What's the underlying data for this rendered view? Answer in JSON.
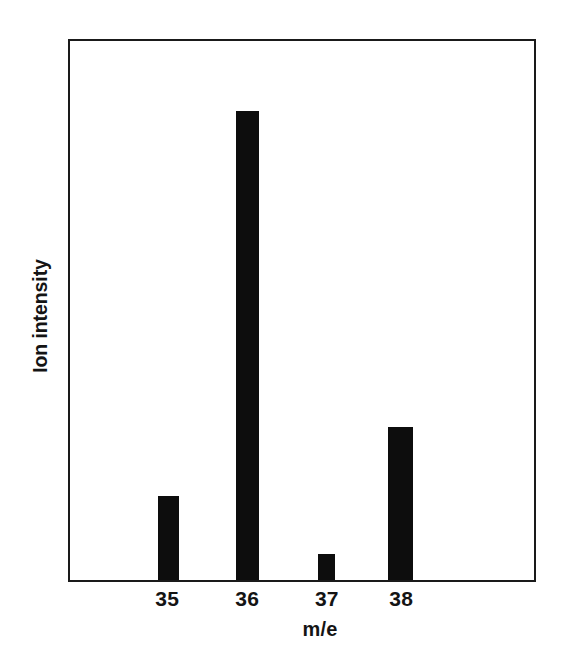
{
  "chart_data": {
    "type": "bar",
    "title": "",
    "subtitle": "",
    "xlabel": "m/e",
    "ylabel": "Ion intensity",
    "categories": [
      "35",
      "36",
      "37",
      "38"
    ],
    "values": [
      15.6,
      87.0,
      4.8,
      28.4
    ],
    "ylim": [
      0,
      100
    ],
    "xlim": [
      34.3,
      39.5
    ],
    "grid": false,
    "legend": null,
    "bar_color": "#0d0d0d",
    "frame_color": "#1a1a1a",
    "background_color": "#ffffff",
    "annotations": [],
    "bars": [
      {
        "label": "35",
        "value": 15.6,
        "center_pct": 21.2,
        "width_pct": 4.5
      },
      {
        "label": "36",
        "value": 87.0,
        "center_pct": 38.3,
        "width_pct": 4.9
      },
      {
        "label": "37",
        "value": 4.8,
        "center_pct": 55.3,
        "width_pct": 3.8
      },
      {
        "label": "38",
        "value": 28.4,
        "center_pct": 71.2,
        "width_pct": 5.3
      }
    ]
  },
  "axes": {
    "y_axis_label": "Ion intensity",
    "x_axis_label": "m/e",
    "x_tick_labels": [
      "35",
      "36",
      "37",
      "38"
    ],
    "y_tick_labels": []
  }
}
